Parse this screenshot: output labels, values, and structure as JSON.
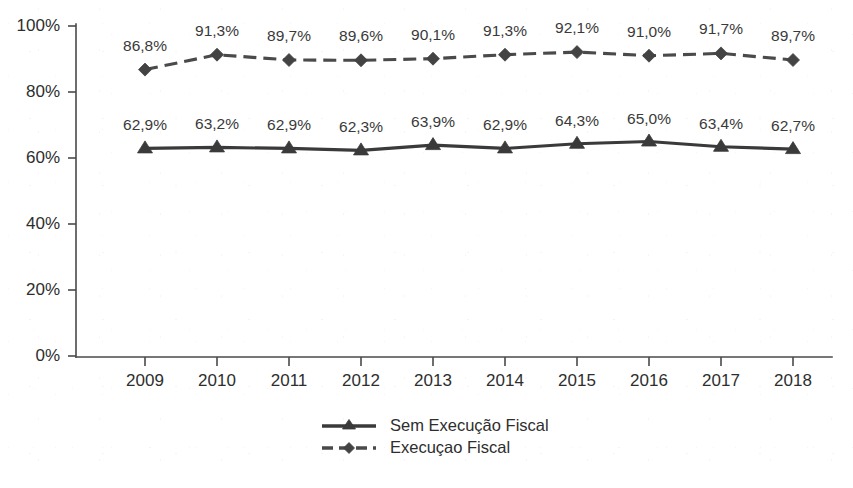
{
  "chart_data": {
    "type": "line",
    "title": "",
    "subtitle": "",
    "xlabel": "",
    "ylabel": "",
    "categories": [
      "2009",
      "2010",
      "2011",
      "2012",
      "2013",
      "2014",
      "2015",
      "2016",
      "2017",
      "2018"
    ],
    "ylim": [
      0,
      100
    ],
    "ytick_labels": [
      "0%",
      "20%",
      "40%",
      "60%",
      "80%",
      "100%"
    ],
    "ytick_values": [
      0,
      20,
      40,
      60,
      80,
      100
    ],
    "grid": false,
    "legend_position": "bottom-center",
    "series": [
      {
        "name": "Sem Execução Fiscal",
        "style": "solid",
        "marker": "triangle",
        "color": "#3a3a3a",
        "values": [
          62.9,
          63.2,
          62.9,
          62.3,
          63.9,
          62.9,
          64.3,
          65.0,
          63.4,
          62.7
        ],
        "data_labels": [
          "62,9%",
          "63,2%",
          "62,9%",
          "62,3%",
          "63,9%",
          "62,9%",
          "64,3%",
          "65,0%",
          "63,4%",
          "62,7%"
        ]
      },
      {
        "name": "Execuçao Fiscal",
        "style": "dashed",
        "marker": "diamond",
        "color": "#4a4a4a",
        "values": [
          86.8,
          91.3,
          89.7,
          89.6,
          90.1,
          91.3,
          92.1,
          91.0,
          91.7,
          89.7
        ],
        "data_labels": [
          "86,8%",
          "91,3%",
          "89,7%",
          "89,6%",
          "90,1%",
          "91,3%",
          "92,1%",
          "91,0%",
          "91,7%",
          "89,7%"
        ]
      }
    ]
  },
  "legend": {
    "items": [
      {
        "label": "Sem Execução Fiscal"
      },
      {
        "label": "Execuçao Fiscal"
      }
    ]
  },
  "colors": {
    "background": "#ffffff",
    "axis": "#4a4a4a",
    "text": "#2e2e2e",
    "series_solid": "#3a3a3a",
    "series_dashed": "#4a4a4a"
  }
}
